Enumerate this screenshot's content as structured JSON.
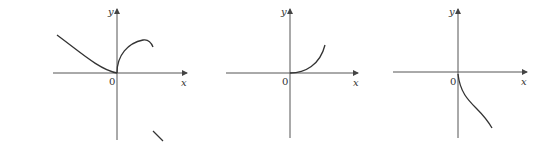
{
  "figure": {
    "panels": [
      {
        "id": "graph-1",
        "labels": {
          "y": "y",
          "origin": "0",
          "x": "x"
        },
        "description": "Curve decreasing to origin from left, then rising sharply from origin to a local max and turning down; a short detached segment below right"
      },
      {
        "id": "graph-2",
        "labels": {
          "y": "y",
          "origin": "0",
          "x": "x"
        },
        "description": "Curve starting at origin with zero slope, increasing and concave up to the right"
      },
      {
        "id": "graph-3",
        "labels": {
          "y": "y",
          "origin": "0",
          "x": "x"
        },
        "description": "Curve starting at origin with vertical tangent, decreasing to the lower right"
      }
    ]
  }
}
